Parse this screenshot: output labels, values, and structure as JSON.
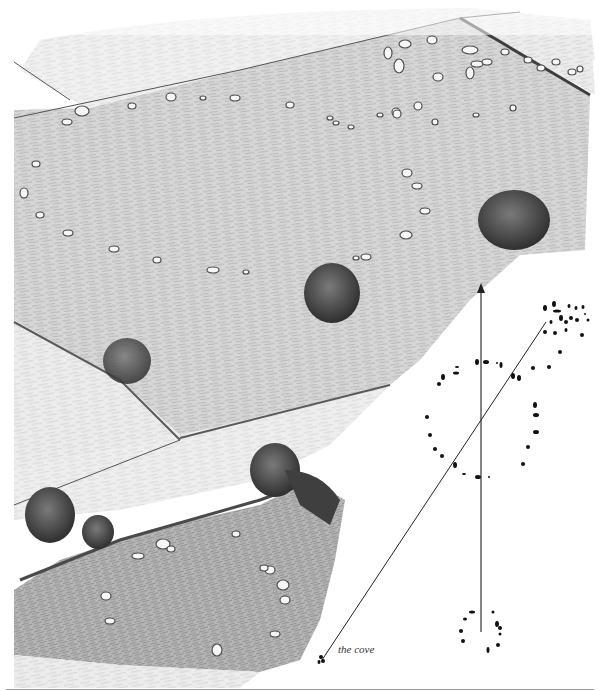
{
  "figure": {
    "type": "illustration-with-plan"
  },
  "colors": {
    "background": "#ffffff",
    "field_light": "#e4e4e4",
    "field_mid": "#cfcfcf",
    "field_dark": "#b5b5b5",
    "tree": "#4a4a4a",
    "hedge": "#6a6a6a",
    "stone_fill": "#f4f4f4",
    "stone_shadow": "#555555",
    "plan_stone": "#111111",
    "plan_line": "#222222",
    "rule": "#9a9a9a"
  },
  "plan": {
    "north_arrow": {
      "x": 481,
      "y_top": 287,
      "y_bottom": 632
    },
    "alignment_line": {
      "x1": 322,
      "y1": 660,
      "x2": 546,
      "y2": 322
    },
    "labels": [
      {
        "text": "the cove",
        "x": 338,
        "y": 649
      }
    ],
    "circles": [
      {
        "name": "large-circle",
        "cx": 482,
        "cy": 415,
        "rx": 55,
        "ry": 58
      },
      {
        "name": "northeast-circle",
        "cx": 565,
        "cy": 318,
        "rx": 22,
        "ry": 14
      },
      {
        "name": "south-circle",
        "cx": 482,
        "cy": 632,
        "rx": 20,
        "ry": 20
      }
    ]
  },
  "scene": {
    "stone_rings": [
      {
        "name": "great-circle-stones",
        "count": 26
      },
      {
        "name": "northeast-circle-stones",
        "count": 20
      },
      {
        "name": "south-circle-stones",
        "count": 12
      }
    ],
    "trees": 6,
    "fences": 3
  }
}
